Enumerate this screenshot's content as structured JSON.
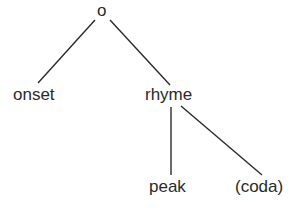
{
  "diagram": {
    "type": "tree",
    "nodes": {
      "root": "o",
      "onset": "onset",
      "rhyme": "rhyme",
      "peak": "peak",
      "coda": "(coda)"
    },
    "edges": [
      [
        "root",
        "onset"
      ],
      [
        "root",
        "rhyme"
      ],
      [
        "rhyme",
        "peak"
      ],
      [
        "rhyme",
        "coda"
      ]
    ],
    "colors": {
      "line": "#2a2a2a",
      "text": "#2a2a2a",
      "background": "#ffffff"
    }
  }
}
